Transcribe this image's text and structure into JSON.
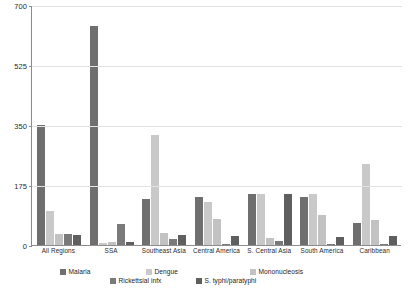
{
  "chart_data": {
    "type": "bar",
    "title": "",
    "subtitle": "",
    "xlabel": "",
    "ylabel": "",
    "ylim": [
      0,
      700
    ],
    "yticks": [
      0,
      175,
      350,
      525,
      700
    ],
    "ytick_labels": [
      "0",
      "175",
      "350",
      "525",
      "700"
    ],
    "grid": true,
    "legend_position": "bottom",
    "categories": [
      "All Regions",
      "SSA",
      "Southeast Asia",
      "Central America",
      "S. Central Asia",
      "South America",
      "Caribbean"
    ],
    "series": [
      {
        "name": "Malaria",
        "color": "#6f6f6f",
        "values": [
          350,
          640,
          135,
          140,
          148,
          140,
          65
        ]
      },
      {
        "name": "Dengue",
        "color": "#c9c9c9",
        "values": [
          100,
          5,
          320,
          125,
          148,
          148,
          235
        ]
      },
      {
        "name": "Mononucleosis",
        "color": "#c2c2c2",
        "values": [
          33,
          8,
          35,
          75,
          20,
          88,
          72
        ]
      },
      {
        "name": "Rickettsial infx",
        "color": "#7a7a7a",
        "values": [
          33,
          60,
          18,
          2,
          12,
          2,
          2
        ]
      },
      {
        "name": "S. typhi/paratyphi",
        "color": "#5f5f5f",
        "values": [
          30,
          8,
          28,
          27,
          148,
          22,
          27
        ]
      }
    ]
  },
  "legend": {
    "rows": [
      [
        "Malaria",
        "Dengue",
        "Mononucleosis"
      ],
      [
        "Rickettsial infx",
        "S. typhi/paratyphi"
      ]
    ]
  },
  "colors": {
    "axis": "#8c8c8c",
    "grid": "#e2e2e2",
    "text": "#1e1e1e",
    "background": "#ffffff"
  }
}
